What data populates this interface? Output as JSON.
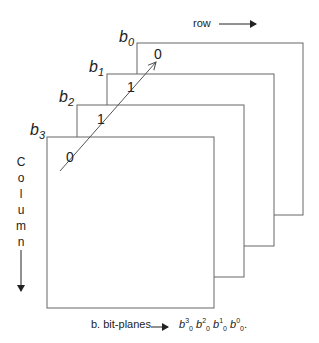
{
  "planes": [
    {
      "label": "b",
      "sub": "0"
    },
    {
      "label": "b",
      "sub": "1"
    },
    {
      "label": "b",
      "sub": "2"
    },
    {
      "label": "b",
      "sub": "3"
    }
  ],
  "bits": [
    "0",
    "1",
    "1",
    "0"
  ],
  "row_label": "row",
  "column_label": [
    "C",
    "o",
    "l",
    "u",
    "m",
    "n"
  ],
  "caption": {
    "prefix": "b. bit-planes",
    "terms": [
      {
        "sup": "3",
        "sub": "0"
      },
      {
        "sup": "2",
        "sub": "0"
      },
      {
        "sup": "1",
        "sub": "0"
      },
      {
        "sup": "0",
        "sub": "0"
      }
    ],
    "suffix": "."
  },
  "colors": {
    "stroke": "#555555",
    "text": "#222222"
  }
}
